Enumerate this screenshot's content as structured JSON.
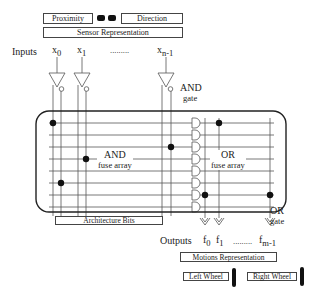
{
  "sensor": {
    "proximity_label": "Proximity",
    "direction_label": "Direction",
    "representation_label": "Sensor Representation"
  },
  "inputs": {
    "label": "Inputs",
    "x0": "x",
    "x0_sub": "0",
    "x1": "x",
    "x1_sub": "1",
    "ellipsis": ".........",
    "xn": "x",
    "xn_sub": "n-1"
  },
  "and_gate": {
    "line1": "AND",
    "line2": "gate"
  },
  "and_array": {
    "line1": "AND",
    "line2": "fuse array"
  },
  "or_array": {
    "line1": "OR",
    "line2": "fuse array"
  },
  "or_gate": {
    "line1": "OR",
    "line2": "gate"
  },
  "architecture_label": "Architecture Bits",
  "outputs": {
    "label": "Outputs",
    "f0": "f",
    "f0_sub": "0",
    "f1": "f",
    "f1_sub": "1",
    "ellipsis": ".........",
    "fm": "f",
    "fm_sub": "m-1"
  },
  "motions": {
    "representation_label": "Motions Representation",
    "left_wheel_label": "Left Wheel",
    "right_wheel_label": "Right Wheel"
  }
}
